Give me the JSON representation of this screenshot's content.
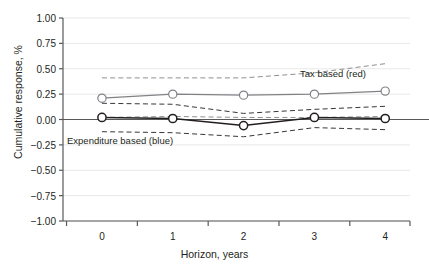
{
  "chart_data": {
    "type": "line",
    "title": "",
    "subtitle": "",
    "xlabel": "Horizon, years",
    "ylabel": "Cumulative response, %",
    "x": [
      0,
      1,
      2,
      3,
      4
    ],
    "xlim": [
      -0.55,
      4.35
    ],
    "ylim": [
      -1.0,
      1.0
    ],
    "xticklabels": [
      "0",
      "1",
      "2",
      "3",
      "4"
    ],
    "yticklabels": [
      "1.00",
      "0.75",
      "0.50",
      "0.25",
      "0.00",
      "−0.25",
      "−0.50",
      "−0.75",
      "−1.00"
    ],
    "ytickvalues": [
      1.0,
      0.75,
      0.5,
      0.25,
      0.0,
      -0.25,
      -0.5,
      -0.75,
      -1.0
    ],
    "grid": "horizontal",
    "grid_color": "#e8e8e8",
    "zero_line": true,
    "zero_line_color": "#58595b",
    "legend_position": "inline-annotations",
    "series": [
      {
        "name": "Tax based (red)",
        "style": "solid-with-open-circle-markers",
        "color": "#808285",
        "values": [
          0.21,
          0.25,
          0.24,
          0.25,
          0.28
        ],
        "ci_upper": [
          0.41,
          0.41,
          0.41,
          0.46,
          0.55
        ],
        "ci_lower": [
          0.02,
          0.03,
          0.02,
          0.02,
          0.03
        ]
      },
      {
        "name": "Expenditure based (blue)",
        "style": "solid-with-open-circle-markers",
        "color": "#231f20",
        "values": [
          0.02,
          0.01,
          -0.06,
          0.02,
          0.01
        ],
        "ci_upper": [
          0.16,
          0.15,
          0.06,
          0.1,
          0.13
        ],
        "ci_lower": [
          -0.12,
          -0.13,
          -0.17,
          -0.08,
          -0.1
        ]
      }
    ],
    "annotations": [
      {
        "text": "Tax based (red)",
        "x": 3.05,
        "y": 0.5
      },
      {
        "text": "Expenditure based (blue)",
        "x": 0.0,
        "y": -0.16
      }
    ]
  }
}
